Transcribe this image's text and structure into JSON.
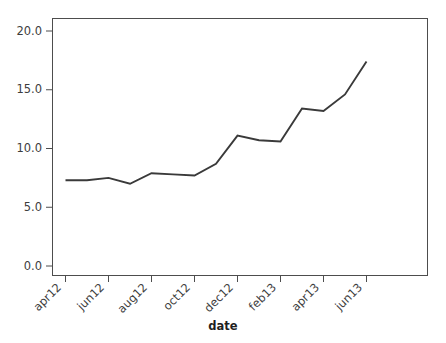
{
  "chart_data": {
    "type": "line",
    "title": "",
    "xlabel": "date",
    "ylabel": "",
    "grid": false,
    "legend": false,
    "ylim": [
      0.0,
      21.0
    ],
    "yticks": [
      0.0,
      5.0,
      10.0,
      15.0,
      20.0
    ],
    "ytick_labels": [
      "0.0",
      "5.0",
      "10.0",
      "15.0",
      "20.0"
    ],
    "xticks": [
      "apr12",
      "jun12",
      "aug12",
      "oct12",
      "dec12",
      "feb13",
      "apr13",
      "jun13"
    ],
    "xtick_labels": [
      "apr12",
      "jun12",
      "aug12",
      "oct12",
      "dec12",
      "feb13",
      "apr13",
      "jun13"
    ],
    "x": [
      "apr12",
      "may12",
      "jun12",
      "jul12",
      "aug12",
      "sep12",
      "oct12",
      "nov12",
      "dec12",
      "jan13",
      "feb13",
      "mar13",
      "apr13",
      "may13",
      "jun13"
    ],
    "values": [
      7.3,
      7.3,
      7.5,
      7.0,
      7.9,
      7.8,
      7.7,
      8.7,
      11.1,
      10.7,
      10.6,
      13.4,
      13.2,
      14.6,
      17.4
    ],
    "series": [
      {
        "name": "value",
        "color": "#3a3a3a",
        "values": [
          7.3,
          7.3,
          7.5,
          7.0,
          7.9,
          7.8,
          7.7,
          8.7,
          11.1,
          10.7,
          10.6,
          13.4,
          13.2,
          14.6,
          17.4
        ]
      }
    ]
  },
  "axis": {
    "x_title": "date",
    "y_tick_0": "0.0",
    "y_tick_1": "5.0",
    "y_tick_2": "10.0",
    "y_tick_3": "15.0",
    "y_tick_4": "20.0",
    "x_tick_0": "apr12",
    "x_tick_1": "jun12",
    "x_tick_2": "aug12",
    "x_tick_3": "oct12",
    "x_tick_4": "dec12",
    "x_tick_5": "feb13",
    "x_tick_6": "apr13",
    "x_tick_7": "jun13"
  },
  "colors": {
    "line": "#3a3a3a",
    "axis": "#4d4d4d",
    "text": "#3d3d3d",
    "background": "#ffffff"
  }
}
